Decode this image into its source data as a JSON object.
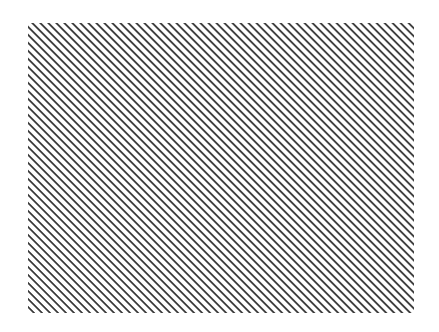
{
  "figure": {
    "description": "Rectangle filled with diagonal hatch lines",
    "pattern": {
      "type": "diagonal-hatch",
      "direction": "top-left to bottom-right",
      "angle_deg": 45,
      "line_color": "#3a3a3a",
      "background_color": "#ffffff",
      "horizontal_period_px": 8
    },
    "region": {
      "left": 28,
      "top": 23,
      "width": 386,
      "height": 290
    }
  }
}
